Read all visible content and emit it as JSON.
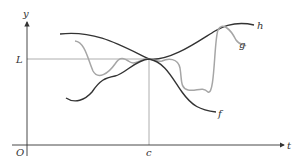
{
  "figure": {
    "type": "squeeze-theorem-diagram",
    "axes": {
      "x_label": "t",
      "y_label": "y",
      "origin_label": "O"
    },
    "reference": {
      "horizontal_label": "L",
      "vertical_label": "c"
    },
    "curves": [
      {
        "name": "h",
        "label": "h",
        "color": "#333333",
        "role": "upper bound"
      },
      {
        "name": "g",
        "label": "g",
        "color": "#a6a6a6",
        "role": "squeezed function"
      },
      {
        "name": "f",
        "label": "f",
        "color": "#333333",
        "role": "lower bound"
      }
    ],
    "colors": {
      "axis": "#333333",
      "guide": "#9a9a9a",
      "dark_curve": "#333333",
      "light_curve": "#a6a6a6"
    }
  }
}
